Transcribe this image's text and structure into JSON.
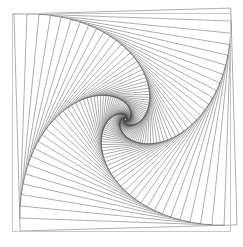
{
  "figure": {
    "kind": "geometric-line-drawing",
    "background_color": "#ffffff",
    "canvas": {
      "width": 243,
      "height": 247
    }
  },
  "frame": {
    "name": "outer-border-frame",
    "x": 12,
    "y": 13,
    "width": 218,
    "height": 218,
    "stroke_color": "#c9c9c9",
    "stroke_width": 1
  },
  "chart_data": {
    "type": "line",
    "xlabel": "",
    "ylabel": "",
    "grid": false,
    "legend": null,
    "xlim": [
      12,
      230
    ],
    "ylim": [
      13,
      231
    ],
    "construction": {
      "center_x": 121,
      "center_y": 124,
      "step_fraction": 0.0595,
      "iterations": 84,
      "sides": 4,
      "start_square": {
        "half_size": 108.5,
        "rotation_deg": -1.6,
        "corners": [
          [
            14.0,
            14.2
          ],
          [
            230.8,
            8.1
          ],
          [
            237.0,
            224.9
          ],
          [
            20.2,
            231.0
          ]
        ]
      }
    },
    "style": {
      "stroke_color": "#4a4a4a",
      "stroke_width": 0.45,
      "fill": "none"
    }
  }
}
